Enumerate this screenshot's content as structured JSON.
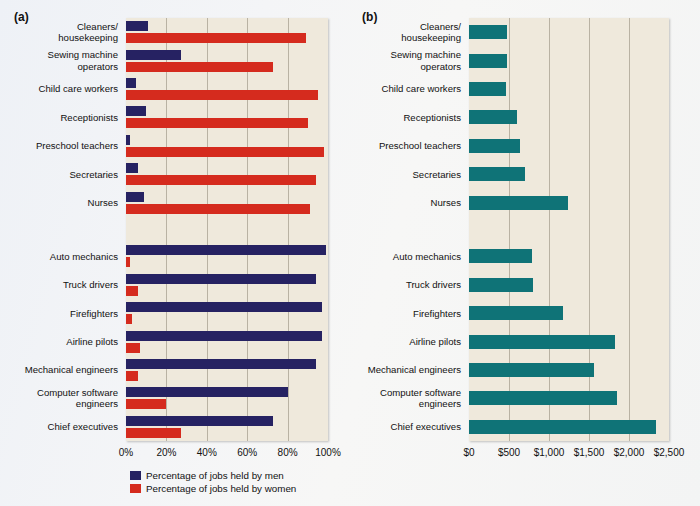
{
  "panels": {
    "a": {
      "tag": "(a)",
      "legend": [
        {
          "key": "men",
          "label": "Percentage of jobs held by men",
          "color": "#262262"
        },
        {
          "key": "women",
          "label": "Percentage of jobs held by women",
          "color": "#d52b1e"
        }
      ]
    },
    "b": {
      "tag": "(b)",
      "legend": [
        {
          "key": "earnings",
          "label": "Median weekly earnings",
          "color": "#0f7377"
        }
      ]
    }
  },
  "chart_data": [
    {
      "type": "bar",
      "orientation": "horizontal",
      "panel": "(a)",
      "title": "",
      "xlabel": "",
      "ylabel": "",
      "xlim": [
        0,
        100
      ],
      "grid": true,
      "legend_position": "bottom-left",
      "tick_labels": [
        "0%",
        "20%",
        "40%",
        "60%",
        "80%",
        "100%"
      ],
      "tick_values": [
        0,
        20,
        40,
        60,
        80,
        100
      ],
      "categories": [
        "Cleaners/\nhousekeeping",
        "Sewing machine\noperators",
        "Child care workers",
        "Receptionists",
        "Preschool teachers",
        "Secretaries",
        "Nurses",
        "Auto mechanics",
        "Truck drivers",
        "Firefighters",
        "Airline pilots",
        "Mechanical engineers",
        "Computer software\nengineers",
        "Chief executives"
      ],
      "series": [
        {
          "name": "Percentage of jobs held by men",
          "color": "#262262",
          "values": [
            11,
            27,
            5,
            10,
            2,
            6,
            9,
            99,
            94,
            97,
            97,
            94,
            80,
            73
          ]
        },
        {
          "name": "Percentage of jobs held by women",
          "color": "#d52b1e",
          "values": [
            89,
            73,
            95,
            90,
            98,
            94,
            91,
            2,
            6,
            3,
            7,
            6,
            20,
            27
          ]
        }
      ]
    },
    {
      "type": "bar",
      "orientation": "horizontal",
      "panel": "(b)",
      "title": "",
      "xlabel": "",
      "ylabel": "",
      "xlim": [
        0,
        2500
      ],
      "grid": true,
      "legend_position": "bottom-center",
      "tick_labels": [
        "$0",
        "$500",
        "$1,000",
        "$1,500",
        "$2,000",
        "$2,500"
      ],
      "tick_values": [
        0,
        500,
        1000,
        1500,
        2000,
        2500
      ],
      "categories": [
        "Cleaners/\nhousekeeping",
        "Sewing machine\noperators",
        "Child care workers",
        "Receptionists",
        "Preschool teachers",
        "Secretaries",
        "Nurses",
        "Auto mechanics",
        "Truck drivers",
        "Firefighters",
        "Airline pilots",
        "Mechanical engineers",
        "Computer software\nengineers",
        "Chief executives"
      ],
      "series": [
        {
          "name": "Median weekly earnings",
          "color": "#0f7377",
          "values": [
            470,
            480,
            460,
            600,
            640,
            700,
            1240,
            790,
            800,
            1170,
            1820,
            1560,
            1850,
            2340
          ]
        }
      ]
    }
  ]
}
